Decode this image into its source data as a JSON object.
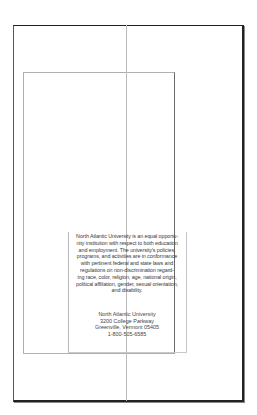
{
  "document": {
    "type": "brochure-page-layout",
    "statement_lines": [
      "North Atlantic University is an equal opportu-",
      "nity institution with respect to both education",
      "and employment. The university's policies,",
      "programs, and activities are in conformance",
      "with pertinent federal and state laws and",
      "regulations on non-discrimination regard-",
      "ing race, color, religion, age, national origin,",
      "political affiliation, gender, sexual orientation,",
      "and disability."
    ],
    "address_lines": [
      "North Atlantic University",
      "3200 College Parkway",
      "Greenville, Vermont 05405",
      "1-800-505-6585"
    ]
  },
  "colors": {
    "page_border": "#222222",
    "guide_line": "#bdbdbd",
    "frame_line": "#b0b0b0",
    "text": "#3a3a3a"
  }
}
